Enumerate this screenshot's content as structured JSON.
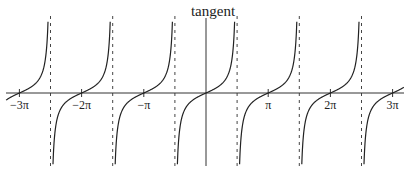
{
  "chart_data": {
    "type": "line",
    "title": "tangent",
    "function": "tan(x)",
    "xlabel": "",
    "ylabel": "",
    "xlim_pi": [
      -3.3,
      3.2
    ],
    "ylim": [
      -8,
      8
    ],
    "grid": false,
    "legend": "none",
    "x_ticks": [
      {
        "value_pi": -3,
        "label": "−3π"
      },
      {
        "value_pi": -2,
        "label": "−2π"
      },
      {
        "value_pi": -1,
        "label": "−π"
      },
      {
        "value_pi": 1,
        "label": "π"
      },
      {
        "value_pi": 2,
        "label": "2π"
      },
      {
        "value_pi": 3,
        "label": "3π"
      }
    ],
    "asymptotes_pi": [
      -2.5,
      -1.5,
      -0.5,
      0.5,
      1.5,
      2.5
    ],
    "branches_pi": [
      [
        -3.5,
        -2.5
      ],
      [
        -2.5,
        -1.5
      ],
      [
        -1.5,
        -0.5
      ],
      [
        -0.5,
        0.5
      ],
      [
        0.5,
        1.5
      ],
      [
        1.5,
        2.5
      ],
      [
        2.5,
        3.5
      ]
    ],
    "colors": {
      "curve": "#222222",
      "axis": "#333333",
      "asymptote": "#444444"
    }
  }
}
